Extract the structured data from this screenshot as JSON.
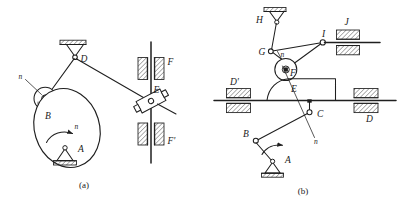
{
  "page": {
    "background": "#ffffff",
    "ink": "#1f1f1f",
    "width": 408,
    "height": 206
  },
  "figures": [
    {
      "id": "figure-a",
      "caption": "(a)",
      "description": "Cam mechanism with oscillating roller follower and slider",
      "labels": {
        "pivot_a": "A",
        "roller_b": "B",
        "pivot_d": "D",
        "slider_e": "E",
        "guide_f": "F",
        "guide_f_prime": "F'",
        "normal_upper": "n",
        "normal_lower": "n"
      }
    },
    {
      "id": "figure-b",
      "caption": "(b)",
      "description": "Compound linkage with crank, sliders, cam plate and roller",
      "labels": {
        "pivot_a": "A",
        "joint_b": "B",
        "joint_c": "C",
        "guide_d": "D",
        "guide_d_prime": "D'",
        "point_e": "E",
        "roller_f": "F",
        "joint_g": "G",
        "pivot_h": "H",
        "joint_i": "I",
        "guide_j": "J",
        "normal_upper": "n",
        "normal_lower": "n"
      }
    }
  ]
}
